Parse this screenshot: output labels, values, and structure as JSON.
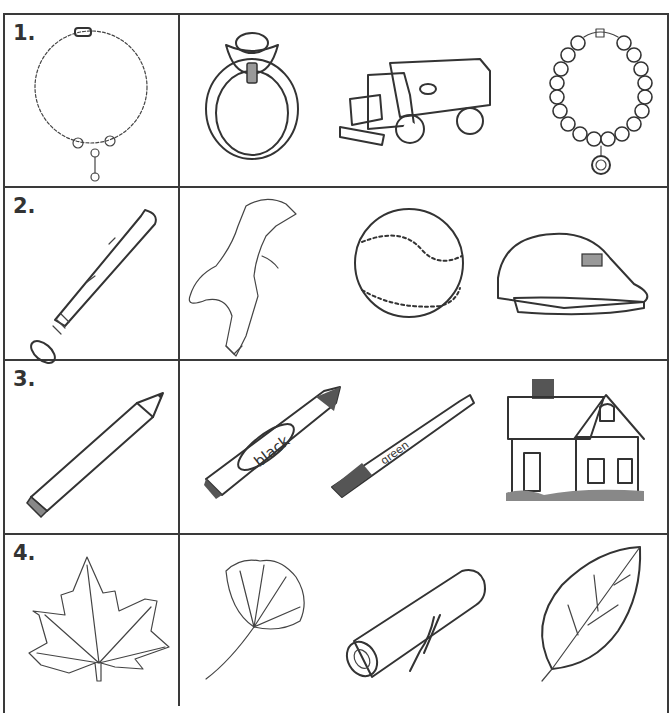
{
  "worksheet": {
    "rows": [
      {
        "number": "1.",
        "target": {
          "name": "chain-necklace",
          "label": "necklace"
        },
        "choices": [
          {
            "name": "ring",
            "label": "ring"
          },
          {
            "name": "toy-dump-truck",
            "label": "dump truck"
          },
          {
            "name": "beaded-bracelet",
            "label": "bracelet"
          }
        ]
      },
      {
        "number": "2.",
        "target": {
          "name": "baseball-bat",
          "label": "bat"
        },
        "choices": [
          {
            "name": "dinosaur",
            "label": "dinosaur"
          },
          {
            "name": "baseball",
            "label": "baseball"
          },
          {
            "name": "baseball-cap",
            "label": "cap"
          }
        ]
      },
      {
        "number": "3.",
        "target": {
          "name": "pencil",
          "label": "pencil"
        },
        "choices": [
          {
            "name": "crayon",
            "label": "crayon",
            "text": "black"
          },
          {
            "name": "marker",
            "label": "marker",
            "text": "green"
          },
          {
            "name": "house",
            "label": "house"
          }
        ]
      },
      {
        "number": "4.",
        "target": {
          "name": "maple-leaf",
          "label": "maple leaf"
        },
        "choices": [
          {
            "name": "ginkgo-leaf",
            "label": "ginkgo leaf"
          },
          {
            "name": "log",
            "label": "log"
          },
          {
            "name": "oval-leaf",
            "label": "leaf"
          }
        ]
      }
    ]
  },
  "colors": {
    "line": "#3a3a3a",
    "shade": "#999999",
    "dark": "#555555"
  }
}
